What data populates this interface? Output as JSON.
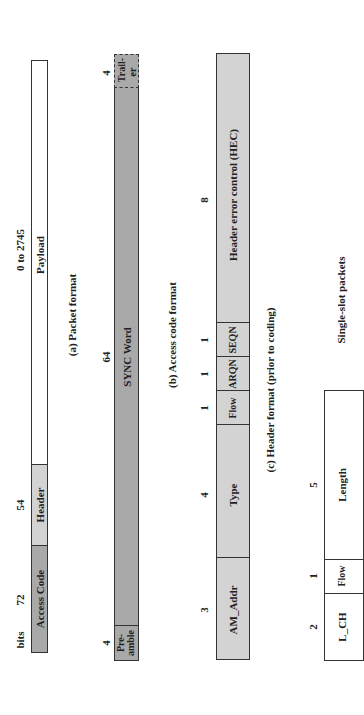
{
  "packet_format": {
    "units_label": "bits",
    "caption": "(a) Packet format",
    "fields": [
      {
        "name": "Access Code",
        "bits": "72"
      },
      {
        "name": "Header",
        "bits": "54"
      },
      {
        "name": "Payload",
        "bits": "0 to 2745"
      }
    ]
  },
  "access_code_format": {
    "caption": "(b) Access code format",
    "fields": [
      {
        "name": "Pre-amble",
        "line1": "Pre-",
        "line2": "amble",
        "bits": "4"
      },
      {
        "name": "SYNC Word",
        "bits": "64"
      },
      {
        "name": "Trailer",
        "line1": "Trail-",
        "line2": "er",
        "bits": "4"
      }
    ]
  },
  "header_format": {
    "caption": "(c) Header format (prior to coding)",
    "fields": [
      {
        "name": "AM_Addr",
        "bits": "3"
      },
      {
        "name": "Type",
        "bits": "4"
      },
      {
        "name": "Flow",
        "bits": "1"
      },
      {
        "name": "ARQN",
        "bits": "1"
      },
      {
        "name": "SEQN",
        "bits": "1"
      },
      {
        "name": "Header error control (HEC)",
        "bits": "8"
      }
    ]
  },
  "payload_header_format": {
    "label": "Single-slot packets",
    "fields": [
      {
        "name": "L_CH",
        "bits": "2"
      },
      {
        "name": "Flow",
        "bits": "1"
      },
      {
        "name": "Length",
        "bits": "5"
      }
    ]
  },
  "colors": {
    "dark_fill": "#a9a9a9",
    "light_fill": "#d3d3d3",
    "white_fill": "#ffffff"
  }
}
